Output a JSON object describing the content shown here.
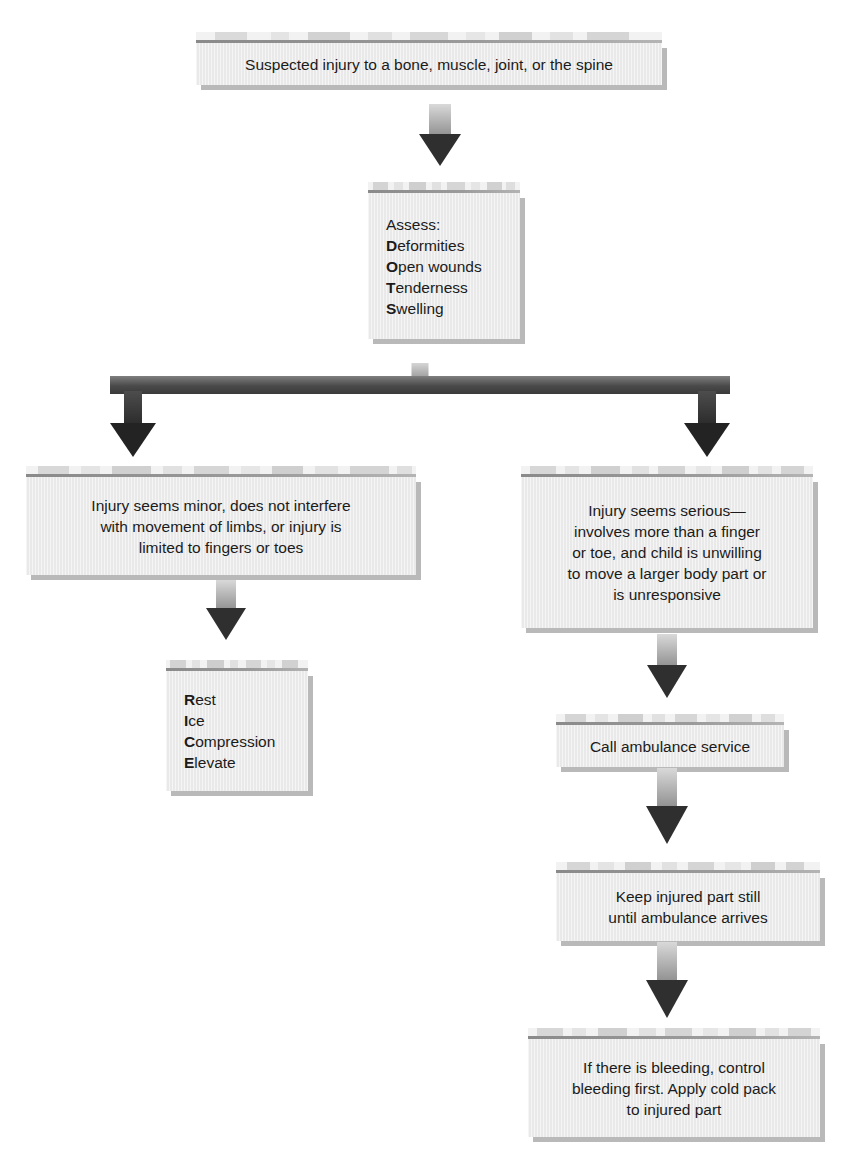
{
  "colors": {
    "box_fill": "#e9e9e9",
    "box_shadow": "#b9b9b9",
    "band_fill": "#f2f2f2",
    "rule": "#8a8a8a",
    "arrow_dark": "#2b2b2b",
    "arrow_light": "#d9d9d9",
    "text": "#1b1b1b",
    "page_background": "#ffffff"
  },
  "nodes": {
    "start": {
      "id": "suspected-injury",
      "text": "Suspected injury to a bone, muscle, joint, or the spine"
    },
    "assess": {
      "id": "assess-dots",
      "heading": "Assess:",
      "items": [
        {
          "initial": "D",
          "rest": "eformities"
        },
        {
          "initial": "O",
          "rest": "pen wounds"
        },
        {
          "initial": "T",
          "rest": "enderness"
        },
        {
          "initial": "S",
          "rest": "welling"
        }
      ],
      "mnemonic": "DOTS"
    },
    "minor": {
      "id": "injury-minor",
      "lines": [
        "Injury seems minor, does not interfere",
        "with movement of limbs, or injury is",
        "limited to fingers or toes"
      ]
    },
    "serious": {
      "id": "injury-serious",
      "lines": [
        "Injury seems serious—",
        "involves more than a finger",
        "or toe, and child is unwilling",
        "to move a larger body part or",
        "is unresponsive"
      ]
    },
    "rice": {
      "id": "rice-treatment",
      "items": [
        {
          "initial": "R",
          "rest": "est"
        },
        {
          "initial": "I",
          "rest": "ce"
        },
        {
          "initial": "C",
          "rest": "ompression"
        },
        {
          "initial": "E",
          "rest": "levate"
        }
      ],
      "mnemonic": "RICE"
    },
    "call": {
      "id": "call-ambulance",
      "text": "Call ambulance service"
    },
    "keep_still": {
      "id": "keep-injured-part-still",
      "lines": [
        "Keep injured part still",
        "until ambulance arrives"
      ]
    },
    "bleeding": {
      "id": "control-bleeding",
      "lines": [
        "If there is bleeding, control",
        "bleeding first. Apply cold pack",
        "to injured part"
      ]
    }
  },
  "flow": {
    "branches": [
      "minor",
      "serious"
    ],
    "left_path": [
      "minor",
      "rice"
    ],
    "right_path": [
      "serious",
      "call",
      "keep_still",
      "bleeding"
    ]
  }
}
